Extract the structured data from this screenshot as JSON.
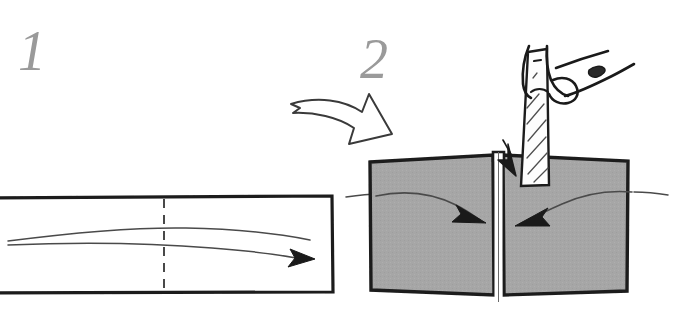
{
  "figure": {
    "background_color": "#ffffff",
    "width": 690,
    "height": 315
  },
  "palette": {
    "ink": "#1a1a1a",
    "ink_soft": "#3a3a3a",
    "grain_line": "#4a4a4a",
    "board_fill": "#a6a6a6",
    "board_edge": "#1c1c1c",
    "blade_fill": "#fdfdfd",
    "hatch": "#4f4f4f",
    "step_label": "#9a9a9a",
    "paper": "#ffffff"
  },
  "steps": [
    {
      "id": "step-1",
      "label": "1",
      "caption_visible": false,
      "description": "Single wide board seen on edge, with a dashed centerline marking the rip cut and a curved grain arrow running left to right.",
      "elements": {
        "board": {
          "name": "board-blank",
          "fill": "#ffffff",
          "stroke": "#1c1c1c",
          "bleeds_left_edge": true
        },
        "centerline": {
          "name": "cut-centerline",
          "style": "dashed",
          "orientation": "vertical"
        },
        "grain_arrow": {
          "name": "grain-direction-arrow",
          "direction": "right",
          "has_arrowhead": true,
          "line_count": 2
        }
      }
    },
    {
      "id": "step-2",
      "label": "2",
      "caption_visible": false,
      "description": "The board has been cut in two and the halves are brought together, grain arrows now pointing inward toward the joint; a hand holds a hatched blade in the gap.",
      "elements": {
        "left_board": {
          "name": "board-left-half",
          "fill": "#a6a6a6",
          "stroke": "#1c1c1c"
        },
        "right_board": {
          "name": "board-right-half",
          "fill": "#a6a6a6",
          "stroke": "#1c1c1c"
        },
        "joint_gap": {
          "name": "joint-gap",
          "fill": "#ffffff",
          "has_top_notch": true
        },
        "left_grain_arrow": {
          "name": "grain-arrow-left",
          "direction": "right-inward",
          "has_arrowhead": true
        },
        "right_grain_arrow": {
          "name": "grain-arrow-right",
          "direction": "left-inward",
          "has_arrowhead": true
        },
        "blade": {
          "name": "blade-tool",
          "fill": "#fdfdfd",
          "hatched": true,
          "hatch_count": 6
        },
        "hand": {
          "name": "hand-holding-blade",
          "style": "line-drawing",
          "finger_count": 3
        },
        "insertion_arrow": {
          "name": "blade-insertion-arrow",
          "direction": "down-into-gap",
          "has_arrowhead": true
        }
      }
    }
  ],
  "transition_arrow": {
    "name": "step-transition-arrow",
    "style": "hand-drawn-outline",
    "fill": "#ffffff",
    "stroke": "#3a3a3a",
    "direction": "down-right",
    "from_step": "1",
    "to_step": "2"
  }
}
